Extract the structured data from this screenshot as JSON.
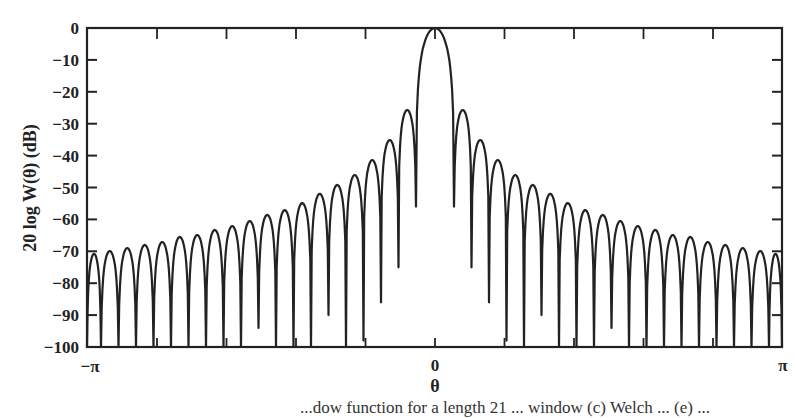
{
  "chart_data": {
    "type": "line",
    "title": "",
    "xlabel": "θ",
    "ylabel": "20 log W(θ) (dB)",
    "xlim": [
      "-π",
      "π"
    ],
    "ylim": [
      -100,
      0
    ],
    "x_tick_labels": [
      "−π",
      "0",
      "π"
    ],
    "y_ticks": [
      0,
      -10,
      -20,
      -30,
      -40,
      -50,
      -60,
      -70,
      -80,
      -90,
      -100
    ],
    "y_tick_labels": [
      "0",
      "−10",
      "−20",
      "−30",
      "−40",
      "−50",
      "−60",
      "−70",
      "−80",
      "−90",
      "−100"
    ],
    "grid": false,
    "legend": null,
    "series": [
      {
        "name": "window spectrum",
        "description": "Symmetric window magnitude response: main lobe at θ=0 (0 dB), 19 sidelobes per side decaying toward the band edges; nulls drop to −100 dB floor",
        "main_lobe_peak_db": 0,
        "main_lobe_null_offset_px": 19,
        "sidelobe_spacing_px": 17.5,
        "sidelobe_peaks_db": [
          -25.7,
          -35.1,
          -41.4,
          -46.1,
          -49.2,
          -52.0,
          -54.9,
          -57.1,
          -58.6,
          -60.5,
          -62.1,
          -63.3,
          -64.9,
          -65.5,
          -67.1,
          -68.0,
          -69.0,
          -69.9,
          -70.8
        ],
        "null_depths_db": [
          -56,
          -75,
          -86,
          -98,
          -100,
          -90,
          -100,
          -100,
          -100,
          -94,
          -100,
          -100,
          -100,
          -100,
          -100,
          -100,
          -100,
          -100,
          -100
        ]
      }
    ]
  },
  "caption": "...dow function for a length 21 ... window (c) Welch ... (e) ..."
}
